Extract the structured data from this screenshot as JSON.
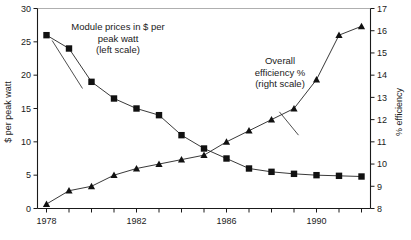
{
  "chart_data": {
    "type": "line",
    "title": "",
    "xlabel": "",
    "x": [
      1978,
      1979,
      1980,
      1981,
      1982,
      1983,
      1984,
      1985,
      1986,
      1987,
      1988,
      1989,
      1990,
      1991,
      1992
    ],
    "xlim": [
      1977.6,
      1992.4
    ],
    "xticks": [
      1978,
      1979,
      1980,
      1981,
      1982,
      1983,
      1984,
      1985,
      1986,
      1987,
      1988,
      1989,
      1990,
      1991,
      1992
    ],
    "xtick_labels": [
      "1978",
      "",
      "",
      "",
      "1982",
      "",
      "",
      "",
      "1986",
      "",
      "",
      "",
      "1990",
      "",
      ""
    ],
    "grid": false,
    "legend_position": "inline-annotations",
    "left_axis": {
      "label": "$ per peak watt",
      "ylim": [
        0,
        30
      ],
      "yticks": [
        0,
        5,
        10,
        15,
        20,
        25,
        30
      ],
      "ytick_labels": [
        "0",
        "5",
        "10",
        "15",
        "20",
        "25",
        "30"
      ]
    },
    "right_axis": {
      "label": "% efficiency",
      "ylim": [
        8,
        17
      ],
      "yticks": [
        8,
        9,
        10,
        11,
        12,
        13,
        14,
        15,
        16,
        17
      ],
      "ytick_labels": [
        "8",
        "9",
        "10",
        "11",
        "12",
        "13",
        "14",
        "15",
        "16",
        "17"
      ]
    },
    "series": [
      {
        "name": "Module prices in $ per peak watt",
        "axis": "left",
        "marker": "square",
        "color": "#111111",
        "values": [
          26.0,
          24.0,
          19.0,
          16.5,
          15.0,
          14.0,
          11.0,
          9.0,
          7.5,
          6.0,
          5.5,
          5.2,
          5.0,
          4.9,
          4.8
        ]
      },
      {
        "name": "Overall efficiency %",
        "axis": "right",
        "marker": "triangle",
        "color": "#111111",
        "values": [
          8.2,
          8.8,
          9.0,
          9.5,
          9.8,
          10.0,
          10.2,
          10.4,
          11.0,
          11.5,
          12.0,
          12.5,
          13.8,
          15.8,
          16.2
        ]
      }
    ],
    "annotations": [
      {
        "name": "module-prices-annotation",
        "lines": [
          "Module prices in $ per",
          "peak watt",
          "(left scale)"
        ],
        "target_series": "Module prices in $ per peak watt"
      },
      {
        "name": "overall-efficiency-annotation",
        "lines": [
          "Overall",
          "efficiency %",
          "(right scale)"
        ],
        "target_series": "Overall efficiency %"
      }
    ]
  }
}
